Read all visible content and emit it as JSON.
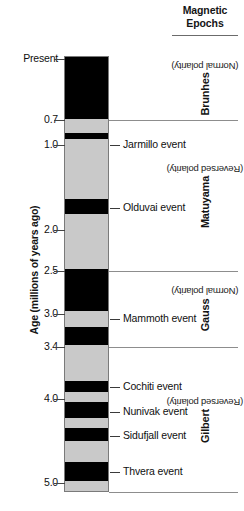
{
  "figure": {
    "header": {
      "line1": "Magnetic",
      "line2": "Epochs"
    },
    "axis": {
      "title": "Age (millions of years ago)",
      "ticks": [
        {
          "label": "Present",
          "value": 0.0,
          "y": 59
        },
        {
          "label": "0.7",
          "value": 0.7,
          "y": 120
        },
        {
          "label": "1.0",
          "value": 1.0,
          "y": 145
        },
        {
          "label": "2.0",
          "value": 2.0,
          "y": 230
        },
        {
          "label": "2.5",
          "value": 2.5,
          "y": 271
        },
        {
          "label": "3.0",
          "value": 3.0,
          "y": 314
        },
        {
          "label": "3.4",
          "value": 3.4,
          "y": 347
        },
        {
          "label": "4.0",
          "value": 4.0,
          "y": 399
        },
        {
          "label": "5.0",
          "value": 5.0,
          "y": 483
        }
      ]
    },
    "column": {
      "normal_color": "#000000",
      "reversed_color": "#c9c9c9",
      "top_value": 0.0,
      "bottom_value": 5.14,
      "normal_bands": [
        {
          "name": "brunhes-normal",
          "from": 0.0,
          "to": 0.73
        },
        {
          "name": "jaramillo-event",
          "from": 0.9,
          "to": 0.97
        },
        {
          "name": "olduvai-event",
          "from": 1.67,
          "to": 1.85
        },
        {
          "name": "gauss-normal-1",
          "from": 2.5,
          "to": 2.99
        },
        {
          "name": "gauss-normal-2",
          "from": 3.18,
          "to": 3.4
        },
        {
          "name": "cochiti-event",
          "from": 3.82,
          "to": 3.95
        },
        {
          "name": "nunivak-event",
          "from": 4.07,
          "to": 4.26
        },
        {
          "name": "sidufjall-event",
          "from": 4.37,
          "to": 4.53
        },
        {
          "name": "thvera-event",
          "from": 4.78,
          "to": 5.0
        }
      ]
    },
    "boundaries": [
      {
        "name": "brunhes-matuyama",
        "value": 0.7,
        "y": 120
      },
      {
        "name": "matuyama-gauss",
        "value": 2.5,
        "y": 271
      },
      {
        "name": "gauss-gilbert",
        "value": 3.4,
        "y": 347
      },
      {
        "name": "gilbert-bottom",
        "value": 5.0,
        "y": 492
      }
    ],
    "events": [
      {
        "label": "Jarmillo event",
        "y": 145
      },
      {
        "label": "Olduvai event",
        "y": 208
      },
      {
        "label": "Mammoth event",
        "y": 319
      },
      {
        "label": "Cochiti event",
        "y": 387
      },
      {
        "label": "Nunivak event",
        "y": 412
      },
      {
        "label": "Sidufjall event",
        "y": 436
      },
      {
        "label": "Thvera event",
        "y": 472
      }
    ],
    "epochs": [
      {
        "name": "Brunhes",
        "polarity": "(Normal polarity)",
        "top": 56,
        "bottom": 120
      },
      {
        "name": "Matuyama",
        "polarity": "(Reversed polarity)",
        "top": 120,
        "bottom": 271
      },
      {
        "name": "Gauss",
        "polarity": "(Normal polarity)",
        "top": 271,
        "bottom": 347
      },
      {
        "name": "Gilbert",
        "polarity": "(Reversed polarity)",
        "top": 347,
        "bottom": 492
      }
    ]
  }
}
